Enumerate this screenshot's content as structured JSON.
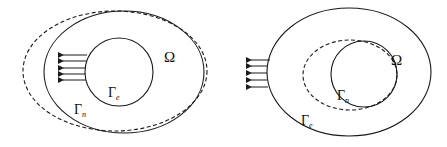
{
  "figure": {
    "panels": [
      {
        "id": "left",
        "domain_label": "Ω",
        "inner_boundary": {
          "symbol": "Γ",
          "subscript": "e"
        },
        "outer_boundary": {
          "symbol": "Γ",
          "subscript": "n"
        },
        "arrow_count": 5,
        "deformed_boundary": "outer",
        "stroke_color": "#1a1a1a"
      },
      {
        "id": "right",
        "domain_label": "Ω",
        "inner_boundary": {
          "symbol": "Γ",
          "subscript": "n"
        },
        "outer_boundary": {
          "symbol": "Γ",
          "subscript": "e"
        },
        "arrow_count": 5,
        "deformed_boundary": "inner",
        "stroke_color": "#1a1a1a"
      }
    ]
  }
}
